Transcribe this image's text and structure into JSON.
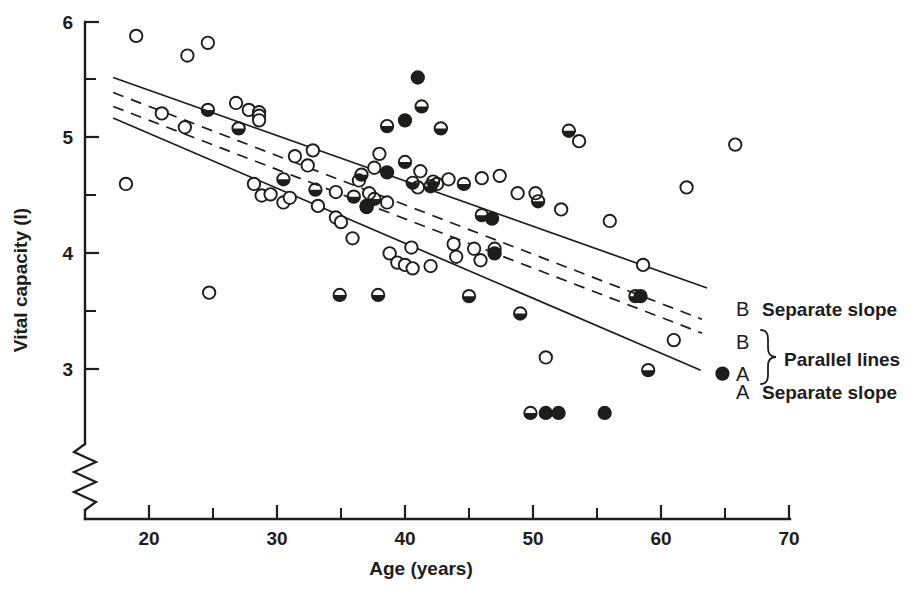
{
  "figure": {
    "caption": "",
    "background": "#ffffff",
    "ink_color": "#1d1d1b"
  },
  "axes": {
    "x_title": "Age  (years)",
    "y_title": "Vital capacity (l)",
    "x_ticks": [
      "20",
      "30",
      "40",
      "50",
      "60",
      "70"
    ],
    "y_ticks": [
      "3",
      "4",
      "5",
      "6"
    ],
    "y_axis_break": "zigzag-break"
  },
  "legend": {
    "entries": [
      {
        "code": "B",
        "label": "Separate slope",
        "style": "solid"
      },
      {
        "code": "B",
        "label": "",
        "style": "dashed"
      },
      {
        "code": "A",
        "label": "",
        "style": "dashed"
      },
      {
        "code": "A",
        "label": "Separate slope",
        "style": "solid"
      }
    ],
    "group_label": "Parallel lines",
    "brace": "}"
  },
  "chart_data": {
    "type": "scatter",
    "title": "",
    "xlabel": "Age  (years)",
    "ylabel": "Vital capacity (l)",
    "xlim": [
      15,
      70
    ],
    "ylim": [
      2.45,
      6.0
    ],
    "x_ticks": [
      20,
      30,
      40,
      50,
      60,
      70
    ],
    "x_minor_ticks": [
      25,
      35,
      45,
      55,
      65
    ],
    "y_ticks": [
      3,
      4,
      5,
      6
    ],
    "y_minor_ticks": [
      3.5,
      4.5,
      5.5
    ],
    "grid": false,
    "legend_position": "right",
    "axis_break": {
      "axis": "y",
      "below": 3.0,
      "symbol": "zigzag"
    },
    "marker_types": {
      "open": "open circle",
      "half": "half-filled circle (lower half black)",
      "full": "filled circle"
    },
    "series": [
      {
        "name": "open",
        "marker": "open circle",
        "points": [
          [
            18.2,
            4.6
          ],
          [
            19.0,
            5.88
          ],
          [
            21.0,
            5.21
          ],
          [
            22.8,
            5.09
          ],
          [
            23.0,
            5.71
          ],
          [
            24.6,
            5.82
          ],
          [
            24.7,
            3.66
          ],
          [
            26.8,
            5.3
          ],
          [
            27.8,
            5.24
          ],
          [
            28.2,
            4.6
          ],
          [
            28.6,
            5.22
          ],
          [
            28.6,
            5.19
          ],
          [
            28.6,
            5.15
          ],
          [
            28.8,
            4.5
          ],
          [
            29.5,
            4.51
          ],
          [
            30.5,
            4.44
          ],
          [
            31.0,
            4.48
          ],
          [
            31.4,
            4.84
          ],
          [
            32.4,
            4.76
          ],
          [
            32.8,
            4.89
          ],
          [
            33.2,
            4.41
          ],
          [
            34.6,
            4.31
          ],
          [
            34.6,
            4.53
          ],
          [
            35.0,
            4.27
          ],
          [
            35.9,
            4.13
          ],
          [
            36.4,
            4.63
          ],
          [
            37.2,
            4.52
          ],
          [
            37.6,
            4.74
          ],
          [
            38.0,
            4.86
          ],
          [
            38.6,
            4.44
          ],
          [
            38.8,
            4.0
          ],
          [
            39.4,
            3.92
          ],
          [
            40.0,
            3.9
          ],
          [
            40.5,
            4.05
          ],
          [
            40.6,
            3.87
          ],
          [
            41.0,
            4.57
          ],
          [
            41.2,
            4.71
          ],
          [
            42.0,
            3.89
          ],
          [
            42.5,
            4.6
          ],
          [
            43.4,
            4.64
          ],
          [
            43.8,
            4.08
          ],
          [
            44.0,
            3.97
          ],
          [
            45.4,
            4.04
          ],
          [
            45.9,
            3.94
          ],
          [
            46.0,
            4.65
          ],
          [
            47.4,
            4.67
          ],
          [
            48.8,
            4.52
          ],
          [
            50.2,
            4.52
          ],
          [
            51.0,
            3.1
          ],
          [
            52.2,
            4.38
          ],
          [
            53.6,
            4.97
          ],
          [
            56.0,
            4.28
          ],
          [
            58.6,
            3.9
          ],
          [
            61.0,
            3.25
          ],
          [
            62.0,
            4.57
          ],
          [
            65.8,
            4.94
          ]
        ]
      },
      {
        "name": "half",
        "marker": "half-filled circle",
        "points": [
          [
            24.6,
            5.24
          ],
          [
            27.0,
            5.08
          ],
          [
            30.5,
            4.64
          ],
          [
            33.0,
            4.55
          ],
          [
            34.9,
            3.64
          ],
          [
            36.0,
            4.49
          ],
          [
            36.6,
            4.68
          ],
          [
            37.0,
            4.4
          ],
          [
            37.6,
            4.47
          ],
          [
            37.9,
            3.64
          ],
          [
            38.6,
            5.1
          ],
          [
            40.0,
            4.79
          ],
          [
            40.6,
            4.61
          ],
          [
            41.3,
            5.27
          ],
          [
            42.0,
            4.58
          ],
          [
            42.2,
            4.62
          ],
          [
            42.8,
            5.08
          ],
          [
            44.6,
            4.6
          ],
          [
            45.0,
            3.63
          ],
          [
            46.0,
            4.33
          ],
          [
            47.0,
            4.04
          ],
          [
            49.0,
            3.48
          ],
          [
            49.8,
            2.62
          ],
          [
            50.4,
            4.45
          ],
          [
            52.8,
            5.06
          ],
          [
            58.0,
            3.63
          ],
          [
            59.0,
            2.99
          ]
        ]
      },
      {
        "name": "full",
        "marker": "filled circle",
        "points": [
          [
            37.0,
            4.41
          ],
          [
            38.6,
            4.7
          ],
          [
            40.0,
            5.15
          ],
          [
            41.0,
            5.52
          ],
          [
            46.8,
            4.3
          ],
          [
            47.0,
            4.0
          ],
          [
            51.0,
            2.62
          ],
          [
            52.0,
            2.62
          ],
          [
            55.6,
            2.62
          ],
          [
            58.4,
            3.63
          ],
          [
            64.8,
            2.96
          ]
        ]
      }
    ],
    "fit_lines": [
      {
        "name": "B separate slope",
        "style": "solid",
        "x0": 17.2,
        "y0": 5.52,
        "x1": 63.6,
        "y1": 3.7
      },
      {
        "name": "B parallel",
        "style": "dashed",
        "x0": 17.2,
        "y0": 5.39,
        "x1": 63.2,
        "y1": 3.43
      },
      {
        "name": "A parallel",
        "style": "dashed",
        "x0": 17.2,
        "y0": 5.27,
        "x1": 63.2,
        "y1": 3.31
      },
      {
        "name": "A separate slope",
        "style": "solid",
        "x0": 17.2,
        "y0": 5.17,
        "x1": 63.1,
        "y1": 2.99
      }
    ]
  }
}
